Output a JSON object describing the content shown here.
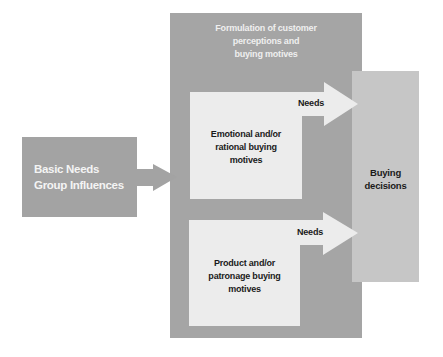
{
  "diagram": {
    "type": "flow",
    "outer_panel": {
      "title_lines": [
        "Formulation of customer",
        "perceptions and",
        "buying motives"
      ]
    },
    "input_box": {
      "lines": [
        "Basic Needs",
        "Group Influences"
      ]
    },
    "motive_boxes": [
      {
        "lines": [
          "Emotional and/or",
          "rational buying",
          "motives"
        ],
        "arrow_label": "Needs"
      },
      {
        "lines": [
          "Product and/or",
          "patronage buying",
          "motives"
        ],
        "arrow_label": "Needs"
      }
    ],
    "output_box": {
      "lines": [
        "Buying",
        "decisions"
      ]
    },
    "colors": {
      "outer_panel": "#a5a5a5",
      "input_box": "#a3a3a3",
      "motive_box": "#ececec",
      "output_box": "#c6c6c6",
      "arrow_light": "#ececec",
      "arrow_dark": "#a3a3a3"
    },
    "edges": [
      {
        "from": "Basic Needs / Group Influences",
        "to": "Formulation of customer perceptions and buying motives"
      },
      {
        "from": "Emotional and/or rational buying motives",
        "to": "Buying decisions",
        "label": "Needs"
      },
      {
        "from": "Product and/or patronage buying motives",
        "to": "Buying decisions",
        "label": "Needs"
      }
    ]
  }
}
